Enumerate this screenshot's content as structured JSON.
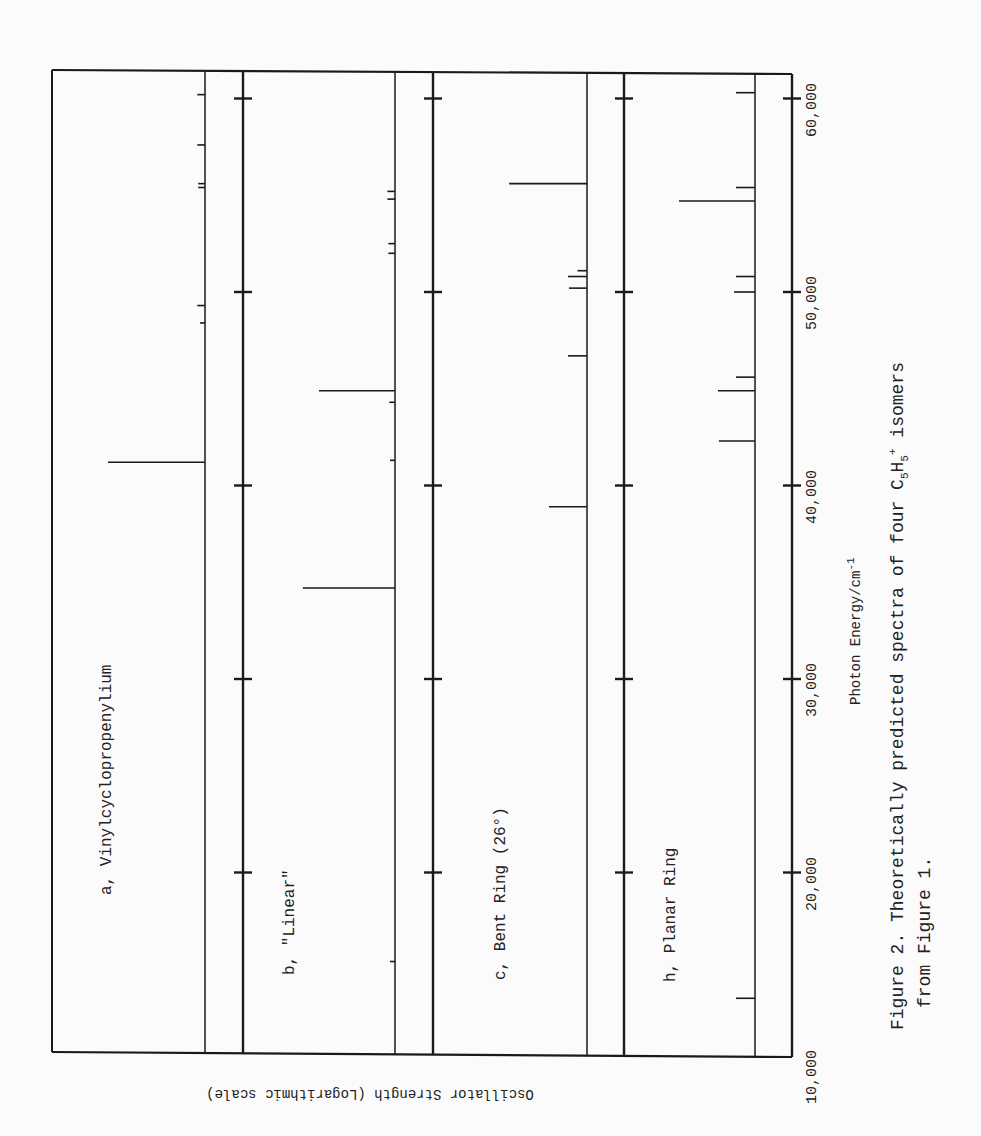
{
  "chart_data": {
    "type": "bar",
    "subtype": "stick-spectrum",
    "orientation": "rotated-90",
    "title": "Figure 2.  Theoretically predicted spectra of four C5H5+ isomers from Figure 1.",
    "xlabel": "Photon Energy/cm-1",
    "ylabel": "Oscillator Strength (Logarithmic scale)",
    "xlim": [
      10000,
      60000
    ],
    "x_ticks": [
      10000,
      20000,
      30000,
      40000,
      50000,
      60000
    ],
    "x_tick_labels": [
      "10,000",
      "20,000",
      "30,000",
      "40,000",
      "50,000",
      "60,000"
    ],
    "y_scale": "log",
    "grid": false,
    "legend": null,
    "panels": [
      {
        "id": "a",
        "name": "Vinylcyclopropenylium",
        "peaks": [
          {
            "energy": 41200,
            "rel_strength": 1.0
          },
          {
            "energy": 48400,
            "rel_strength": 0.05
          },
          {
            "energy": 49300,
            "rel_strength": 0.08
          },
          {
            "energy": 55400,
            "rel_strength": 0.07
          },
          {
            "energy": 55600,
            "rel_strength": 0.07
          },
          {
            "energy": 57600,
            "rel_strength": 0.08
          },
          {
            "energy": 60200,
            "rel_strength": 0.08
          }
        ]
      },
      {
        "id": "b",
        "name": "\"Linear\"",
        "peaks": [
          {
            "energy": 15400,
            "rel_strength": 0.04
          },
          {
            "energy": 34700,
            "rel_strength": 0.97
          },
          {
            "energy": 41300,
            "rel_strength": 0.05
          },
          {
            "energy": 44300,
            "rel_strength": 0.06
          },
          {
            "energy": 44900,
            "rel_strength": 0.8
          },
          {
            "energy": 52000,
            "rel_strength": 0.07
          },
          {
            "energy": 52500,
            "rel_strength": 0.07
          },
          {
            "energy": 54800,
            "rel_strength": 0.08
          },
          {
            "energy": 55200,
            "rel_strength": 0.08
          }
        ]
      },
      {
        "id": "c",
        "name": "Bent Ring (26°)",
        "peaks": [
          {
            "energy": 38900,
            "rel_strength": 0.4
          },
          {
            "energy": 46700,
            "rel_strength": 0.2
          },
          {
            "energy": 50200,
            "rel_strength": 0.19
          },
          {
            "energy": 50800,
            "rel_strength": 0.2
          },
          {
            "energy": 51100,
            "rel_strength": 0.1
          },
          {
            "energy": 55600,
            "rel_strength": 0.82
          }
        ]
      },
      {
        "id": "h",
        "name": "Planar Ring",
        "peaks": [
          {
            "energy": 13500,
            "rel_strength": 0.2
          },
          {
            "energy": 42300,
            "rel_strength": 0.38
          },
          {
            "energy": 44900,
            "rel_strength": 0.39
          },
          {
            "energy": 45600,
            "rel_strength": 0.2
          },
          {
            "energy": 50000,
            "rel_strength": 0.22
          },
          {
            "energy": 50800,
            "rel_strength": 0.2
          },
          {
            "energy": 54700,
            "rel_strength": 0.8
          },
          {
            "energy": 55400,
            "rel_strength": 0.2
          },
          {
            "energy": 60300,
            "rel_strength": 0.2
          }
        ]
      }
    ]
  },
  "labels": {
    "panel_a": "a, Vinylcyclopropenylium",
    "panel_b": "b, \"Linear\"",
    "panel_c": "c, Bent Ring (26°)",
    "panel_h": "h, Planar Ring",
    "xlabel_main": "Photon Energy/cm",
    "xlabel_sup": "-1",
    "ylabel": "Oscillator Strength (Logarithmic scale)",
    "caption_line1_pre": "Figure 2.  Theoretically predicted spectra of four C",
    "caption_sub1": "5",
    "caption_mid": "H",
    "caption_sub2": "5",
    "caption_sup": "+",
    "caption_post": " isomers",
    "caption_line2": "from Figure 1.",
    "ticks": [
      "10,000",
      "20,000",
      "30,000",
      "40,000",
      "50,000",
      "60,000"
    ]
  },
  "colors": {
    "ink": "#1a1a1a",
    "paper": "#fbfbfb"
  }
}
